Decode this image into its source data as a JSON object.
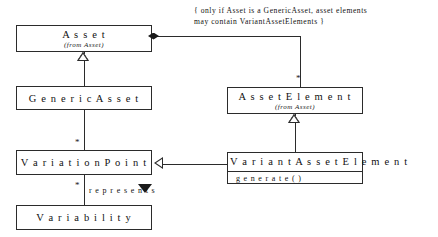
{
  "diagram": {
    "note": "{ only if Asset is a GenericAsset, asset elements\nmay contain VariantAssetElements }",
    "classes": [
      {
        "id": "asset",
        "name": "A s s e t",
        "from": "(from Asset)"
      },
      {
        "id": "generic-asset",
        "name": "G e n e r i c A s s e t",
        "from": ""
      },
      {
        "id": "asset-element",
        "name": "A s s e t E l e m e n t",
        "from": "(from Asset)"
      },
      {
        "id": "variation-point",
        "name": "V a r i a t i o n P o i n t",
        "from": ""
      },
      {
        "id": "variant-asset-element",
        "name": "V a r i a n t A s s e t E l e m e n t",
        "from": "",
        "operation": "g e n e r a t e ( )"
      },
      {
        "id": "variability",
        "name": "V a r i a b i l i t y",
        "from": ""
      }
    ],
    "multiplicities": {
      "asset_element_many": "*",
      "variation_point_top": "*",
      "variation_point_bottom": "*"
    },
    "association_labels": {
      "represents": "r e p r e s e n t s"
    },
    "colors": {
      "background": "#ffffff",
      "stroke": "#2b2b2b",
      "text": "#111111",
      "fill": "#ffffff"
    }
  }
}
